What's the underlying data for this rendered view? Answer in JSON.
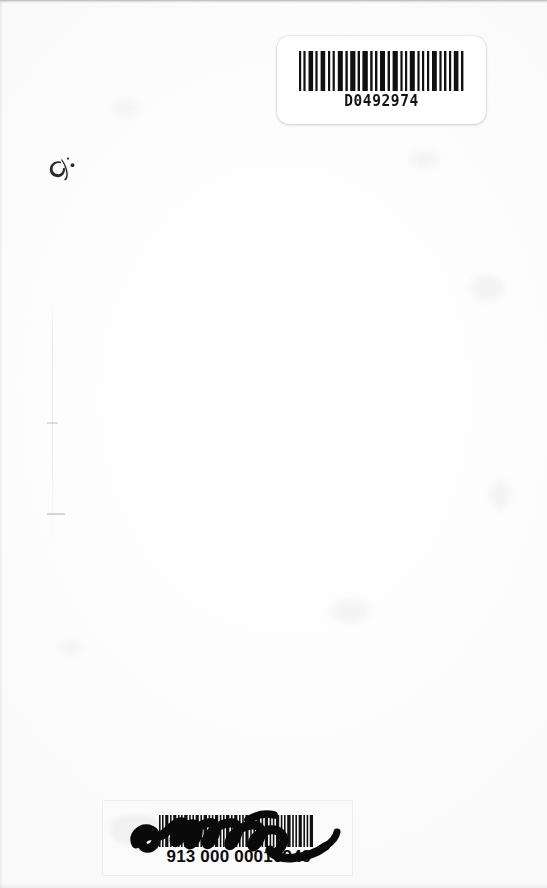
{
  "page": {
    "kind": "scanned-book-page",
    "background_color": "#fefefe",
    "width": 547,
    "height": 888
  },
  "top_label": {
    "name": "top-barcode-sticker",
    "code_text": "D0492974",
    "symbology": "Code 39",
    "ink_color": "#131313",
    "sticker_color": "#ffffff"
  },
  "bottom_label": {
    "name": "bottom-barcode-sticker",
    "code_text": "913 000 00010949",
    "symbology": "Code 39",
    "ink_color": "#0d0d0d",
    "sticker_color": "#fbfbfb"
  },
  "annotations": {
    "signature": "handwritten signature scrawl",
    "ink_glyph": "handwritten ink mark",
    "margin_ticks": [
      "tick-mark-upper",
      "tick-mark-lower"
    ],
    "crease": "vertical fold crease"
  }
}
